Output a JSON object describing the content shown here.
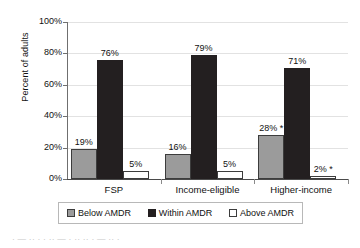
{
  "chart_data": {
    "type": "bar",
    "title": "",
    "xlabel": "",
    "ylabel": "Percent of adults",
    "ylim": [
      0,
      100
    ],
    "ytick_labels": [
      "100%",
      "80%",
      "60%",
      "40%",
      "20%",
      "0%"
    ],
    "ytick_values": [
      100,
      80,
      60,
      40,
      20,
      0
    ],
    "grid": true,
    "legend_position": "bottom",
    "categories": [
      "FSP",
      "Income-eligible",
      "Higher-income"
    ],
    "series": [
      {
        "name": "Below AMDR",
        "color": "#9b9b9b",
        "values": [
          19,
          16,
          28
        ],
        "labels": [
          "19%",
          "16%",
          "28% *"
        ]
      },
      {
        "name": "Within AMDR",
        "color": "#231f20",
        "values": [
          76,
          79,
          71
        ],
        "labels": [
          "76%",
          "79%",
          "71%"
        ]
      },
      {
        "name": "Above AMDR",
        "color": "#ffffff",
        "values": [
          5,
          5,
          2
        ],
        "labels": [
          "5%",
          "5%",
          "2% *"
        ]
      }
    ]
  },
  "legend": {
    "items": [
      {
        "label": "Below AMDR",
        "swatch": "below"
      },
      {
        "label": "Within AMDR",
        "swatch": "within"
      },
      {
        "label": "Above AMDR",
        "swatch": "above"
      }
    ]
  },
  "caption": {
    "cutoff_text": "· — ·· · · ·· — · ·· ·· · — ·· ·"
  }
}
